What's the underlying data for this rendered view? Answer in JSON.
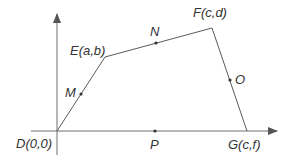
{
  "diagram": {
    "type": "coordinate-geometry-quadrilateral",
    "colors": {
      "line": "#5a5a5a",
      "axis": "#6e6e6e",
      "text": "#333333",
      "background": "#ffffff"
    },
    "vertices": [
      {
        "id": "D",
        "label": "D(0,0)",
        "coords": "(0,0)"
      },
      {
        "id": "E",
        "label": "E(a,b)",
        "coords": "(a,b)"
      },
      {
        "id": "F",
        "label": "F(c,d)",
        "coords": "(c,d)"
      },
      {
        "id": "G",
        "label": "G(c,f)",
        "coords": "(c,f)"
      }
    ],
    "midpoints": [
      {
        "id": "M",
        "label": "M",
        "side": "DE"
      },
      {
        "id": "N",
        "label": "N",
        "side": "EF"
      },
      {
        "id": "O",
        "label": "O",
        "side": "FG"
      },
      {
        "id": "P",
        "label": "P",
        "side": "DG"
      }
    ],
    "edges": [
      "DE",
      "EF",
      "FG",
      "GD"
    ],
    "axes": {
      "x_arrow": true,
      "y_arrow": true
    }
  }
}
